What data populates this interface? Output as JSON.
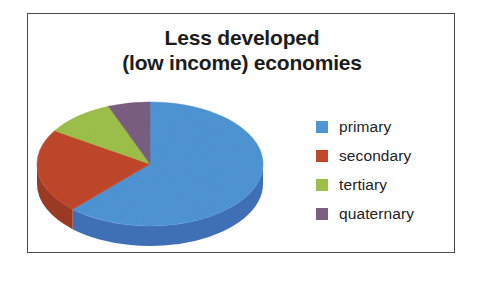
{
  "chart_data": {
    "type": "pie",
    "title": "Less developed (low income) economies",
    "title_lines": [
      "Less developed",
      "(low income) economies"
    ],
    "categories": [
      "primary",
      "secondary",
      "tertiary",
      "quaternary"
    ],
    "values": [
      62,
      22,
      10,
      6
    ],
    "unit": "percent",
    "colors": [
      "#4f94d4",
      "#c0472b",
      "#9dc04a",
      "#7a5f80"
    ],
    "side_colors": [
      "#3f6fb5",
      "#9b3a22",
      "#7d9a3a",
      "#614a66"
    ],
    "legend_position": "right",
    "grid": false,
    "xlabel": "",
    "ylabel": "",
    "three_d": true,
    "start_angle_deg": 0,
    "direction": "clockwise"
  },
  "frame": {
    "border_color": "#4b4b4f",
    "background": "#ffffff"
  },
  "legend": {
    "items": [
      {
        "label": "primary",
        "color": "#4f94d4"
      },
      {
        "label": "secondary",
        "color": "#c0472b"
      },
      {
        "label": "tertiary",
        "color": "#9dc04a"
      },
      {
        "label": "quaternary",
        "color": "#7a5f80"
      }
    ]
  }
}
